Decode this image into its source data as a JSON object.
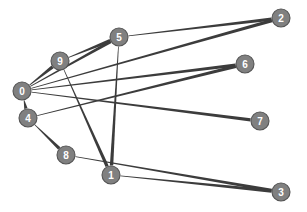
{
  "figure": {
    "type": "directed-graph",
    "width": 307,
    "height": 212,
    "background_color": "#ffffff"
  },
  "style": {
    "node_fill": "#808080",
    "node_stroke": "#545454",
    "node_radius": 9,
    "node_label_color": "#ffffff",
    "edge_color": "#3c3c3c",
    "edge_tail_width": 0.7,
    "edge_head_width": 3.4
  },
  "chart_data": {
    "type": "scatter",
    "title": "",
    "xlabel": "",
    "ylabel": "",
    "grid": false,
    "legend": "none",
    "xlim": [
      0,
      307
    ],
    "ylim": [
      0,
      212
    ],
    "nodes": [
      {
        "id": "0",
        "label": "0",
        "x": 22,
        "y": 91
      },
      {
        "id": "1",
        "label": "1",
        "x": 111,
        "y": 175
      },
      {
        "id": "2",
        "label": "2",
        "x": 281,
        "y": 18
      },
      {
        "id": "3",
        "label": "3",
        "x": 281,
        "y": 192
      },
      {
        "id": "4",
        "label": "4",
        "x": 28,
        "y": 118
      },
      {
        "id": "5",
        "label": "5",
        "x": 119,
        "y": 37
      },
      {
        "id": "6",
        "label": "6",
        "x": 245,
        "y": 64
      },
      {
        "id": "7",
        "label": "7",
        "x": 260,
        "y": 121
      },
      {
        "id": "8",
        "label": "8",
        "x": 66,
        "y": 155
      },
      {
        "id": "9",
        "label": "9",
        "x": 60,
        "y": 61
      }
    ],
    "edges": [
      {
        "source": "0",
        "target": "9"
      },
      {
        "source": "0",
        "target": "5"
      },
      {
        "source": "0",
        "target": "4"
      },
      {
        "source": "0",
        "target": "6"
      },
      {
        "source": "0",
        "target": "7"
      },
      {
        "source": "0",
        "target": "2"
      },
      {
        "source": "9",
        "target": "5"
      },
      {
        "source": "9",
        "target": "1"
      },
      {
        "source": "5",
        "target": "2"
      },
      {
        "source": "5",
        "target": "1"
      },
      {
        "source": "4",
        "target": "8"
      },
      {
        "source": "4",
        "target": "6"
      },
      {
        "source": "8",
        "target": "3"
      },
      {
        "source": "1",
        "target": "3"
      }
    ]
  }
}
